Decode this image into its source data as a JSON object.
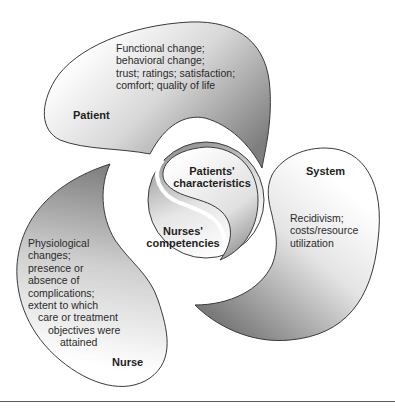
{
  "diagram": {
    "type": "outcomes-model",
    "colors": {
      "outline": "#3a3a3a",
      "fill_dark": "#8a8a8a",
      "fill_light": "#ffffff",
      "text": "#2a2a2a"
    },
    "lobes": [
      {
        "id": "patient",
        "title": "Patient",
        "lines": [
          "Functional change;",
          "behavioral change;",
          "trust; ratings; satisfaction;",
          "comfort; quality of life"
        ]
      },
      {
        "id": "system",
        "title": "System",
        "lines": [
          "Recidivism;",
          "costs/resource",
          "utilization"
        ]
      },
      {
        "id": "nurse",
        "title": "Nurse",
        "lines": [
          "Physiological",
          "changes;",
          "presence or",
          "absence of",
          "complications;",
          "extent to which",
          "care or treatment",
          "objectives were",
          "attained"
        ]
      }
    ],
    "center": {
      "top": {
        "line1": "Patients'",
        "line2": "characteristics"
      },
      "bottom": {
        "line1": "Nurses'",
        "line2": "competencies"
      }
    }
  }
}
